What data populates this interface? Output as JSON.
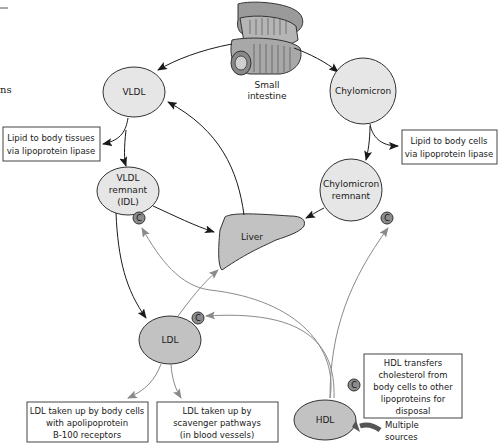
{
  "page_fragments": {
    "top_left_fragment": "",
    "left_margin_fragment": "ns"
  },
  "nodes": {
    "intestine": {
      "line1": "Small",
      "line2": "intestine"
    },
    "vldl": {
      "label": "VLDL"
    },
    "chylomicron": {
      "label": "Chylomicron"
    },
    "idl": {
      "line1": "VLDL",
      "line2": "remnant",
      "line3": "(IDL)"
    },
    "chylo_remnant": {
      "line1": "Chylomicron",
      "line2": "remnant"
    },
    "liver": {
      "label": "Liver"
    },
    "ldl": {
      "label": "LDL"
    },
    "hdl": {
      "label": "HDL"
    }
  },
  "cholesterol_badge": "C",
  "boxes": {
    "lipid_tissues": [
      "Lipid to body tissues",
      "via lipoprotein lipase"
    ],
    "lipid_cells": [
      "Lipid to body cells",
      "via lipoprotein lipase"
    ],
    "ldl_body_cells": [
      "LDL taken up by body cells",
      "with apolipoprotein",
      "B-100 receptors"
    ],
    "ldl_scavenger": [
      "LDL taken up by",
      "scavenger pathways",
      "(in blood vessels)"
    ],
    "hdl_transfer": [
      "HDL transfers",
      "cholesterol from",
      "body cells to other",
      "lipoproteins for",
      "disposal"
    ]
  },
  "multiple_sources": [
    "Multiple",
    "sources"
  ],
  "colors": {
    "node_fill": "#e6e6e6",
    "node_dark_fill": "#c2c2c2",
    "badge_fill": "#8c8c8c",
    "dark_arrow": "#1a1a1a",
    "gray_arrow": "#8a8a8a"
  }
}
